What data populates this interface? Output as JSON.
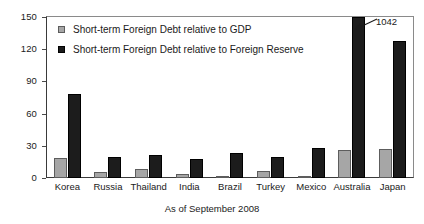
{
  "chart_data": {
    "type": "bar",
    "title": "",
    "xlabel": "As of September 2008",
    "ylabel": "",
    "ylim": [
      0,
      150
    ],
    "yticks": [
      0,
      30,
      60,
      90,
      120,
      150
    ],
    "grid": false,
    "legend_position": "inside-top-left",
    "categories": [
      "Korea",
      "Russia",
      "Thailand",
      "India",
      "Brazil",
      "Turkey",
      "Mexico",
      "Australia",
      "Japan"
    ],
    "series": [
      {
        "name": "Short-term Foreign Debt relative to GDP",
        "color": "#a6a6a6",
        "values": [
          19,
          6,
          8,
          4,
          2,
          7,
          2,
          26,
          27
        ]
      },
      {
        "name": "Short-term Foreign Debt relative to Foreign Reserve",
        "color": "#1c1c1c",
        "values": [
          78,
          20,
          21,
          18,
          23,
          20,
          28,
          1042,
          128
        ]
      }
    ],
    "annotations": [
      {
        "text": "1042",
        "target_category": "Australia",
        "target_series": "Short-term Foreign Debt relative to Foreign Reserve",
        "note": "bar clipped at axis maximum"
      }
    ]
  },
  "axis": {
    "y_tick_labels": [
      "150",
      "120",
      "90",
      "60",
      "30",
      "0"
    ]
  },
  "legend": {
    "items": [
      {
        "label": "Short-term Foreign Debt relative to GDP",
        "swatch": "gdp"
      },
      {
        "label": "Short-term Foreign Debt relative to Foreign Reserve",
        "swatch": "reserve"
      }
    ]
  },
  "annotation": {
    "value_label": "1042"
  },
  "caption": {
    "text": "As of September 2008"
  }
}
